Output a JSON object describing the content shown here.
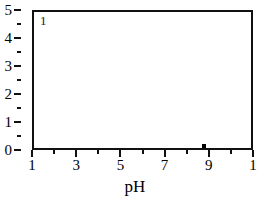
{
  "chart_data": {
    "type": "scatter",
    "title": "",
    "xlabel": "pH",
    "ylabel": "",
    "xlim": [
      1,
      11
    ],
    "ylim": [
      0,
      5
    ],
    "grid": false,
    "legend": null,
    "annotations": [
      {
        "text": "1",
        "x": 1.3,
        "y": 4.75,
        "name": "panel-label"
      }
    ],
    "x_ticks_major": [
      1,
      2,
      3,
      4,
      5,
      6,
      7,
      8,
      9,
      10,
      11
    ],
    "x_tick_labels": [
      {
        "value": 1,
        "label": "1"
      },
      {
        "value": 3,
        "label": "3"
      },
      {
        "value": 5,
        "label": "5"
      },
      {
        "value": 7,
        "label": "7"
      },
      {
        "value": 9,
        "label": "9"
      },
      {
        "value": 11,
        "label": "1"
      }
    ],
    "y_ticks_major": [
      0,
      1,
      2,
      3,
      4,
      5
    ],
    "y_ticks_minor": [
      0.5,
      1.5,
      2.5,
      3.5,
      4.5
    ],
    "y_tick_labels": [
      {
        "value": 5,
        "label": "5"
      },
      {
        "value": 4,
        "label": "4"
      },
      {
        "value": 3,
        "label": "3"
      },
      {
        "value": 2,
        "label": "2"
      },
      {
        "value": 1,
        "label": "1"
      },
      {
        "value": 0,
        "label": "0"
      }
    ],
    "series": [
      {
        "name": "data",
        "marker": "square",
        "color": "#000000",
        "points": [
          {
            "x": 8.7,
            "y": 0.2
          }
        ]
      }
    ]
  },
  "colors": {
    "background": "#ffffff",
    "axis": "#111111",
    "text": "#000000",
    "marker": "#000000"
  }
}
